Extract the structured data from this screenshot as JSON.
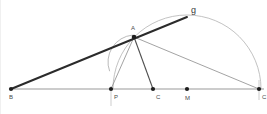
{
  "figure": {
    "type": "geometry-construction",
    "width": 267,
    "height": 114,
    "background": "#ffffff"
  },
  "colors": {
    "baseline": "#9a9a9a",
    "thick_ray": "#2b2b2b",
    "thin_ray": "#8c8c8c",
    "mid_ray": "#4f4f4f",
    "arc": "#b3b3b3",
    "point": "#1d1d1d",
    "label": "#4a4a4a"
  },
  "points": [
    {
      "id": "B",
      "label": "B",
      "x": 10,
      "y": 89,
      "label_x": 8,
      "label_y": 99
    },
    {
      "id": "P",
      "label": "P",
      "x": 110,
      "y": 89,
      "label_x": 113,
      "label_y": 99
    },
    {
      "id": "C",
      "label": "C",
      "x": 152,
      "y": 89,
      "label_x": 155,
      "label_y": 99
    },
    {
      "id": "M",
      "label": "M",
      "x": 186,
      "y": 89,
      "label_x": 184,
      "label_y": 100
    },
    {
      "id": "Cp",
      "label": "C",
      "x": 258,
      "y": 89,
      "label_x": 261,
      "label_y": 99
    },
    {
      "id": "A",
      "label": "A",
      "x": 133,
      "y": 37,
      "label_x": 130,
      "label_y": 30
    }
  ],
  "line_labels": [
    {
      "id": "g",
      "label": "g",
      "x": 190,
      "y": 13
    }
  ],
  "segments": [
    {
      "id": "baseline",
      "name": "baseline-B-to-Cprime",
      "x1": 10,
      "y1": 89,
      "x2": 263,
      "y2": 89,
      "style": "baseline"
    },
    {
      "id": "ray-g",
      "name": "ray-B-through-A-to-g",
      "x1": 10,
      "y1": 89,
      "x2": 186,
      "y2": 17,
      "style": "ray-thick"
    },
    {
      "id": "A-to-Cp",
      "name": "segment-A-to-Cprime",
      "x1": 133,
      "y1": 37,
      "x2": 258,
      "y2": 89,
      "style": "ray-thin"
    },
    {
      "id": "A-to-P",
      "name": "segment-A-to-P",
      "x1": 133,
      "y1": 37,
      "x2": 110,
      "y2": 89,
      "style": "ray-thin"
    },
    {
      "id": "A-to-C",
      "name": "segment-A-to-C",
      "x1": 133,
      "y1": 37,
      "x2": 152,
      "y2": 89,
      "style": "ray-mid"
    }
  ],
  "arcs": [
    {
      "id": "semicircle-M",
      "name": "semicircle-centered-M",
      "cx": 186,
      "cy": 89,
      "r": 74,
      "start_deg": 180,
      "end_deg": 0,
      "style": "arc-big"
    },
    {
      "id": "arc-small-AP",
      "name": "arc-through-A-and-P",
      "cx": 134,
      "cy": 62,
      "r": 27,
      "start_deg": 200,
      "end_deg": 95,
      "style": "arc-small"
    }
  ],
  "ticks": [
    {
      "id": "tick-P",
      "name": "vertical-tick-at-P",
      "x": 110,
      "y1": 86,
      "y2": 106
    },
    {
      "id": "tick-Cp",
      "name": "vertical-tick-at-Cprime",
      "x": 258,
      "y1": 80,
      "y2": 100
    }
  ]
}
